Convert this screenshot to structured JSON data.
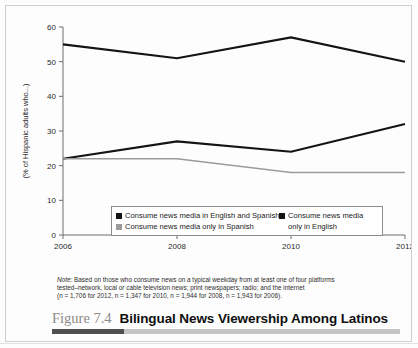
{
  "caption": {
    "figure_number": "Figure 7.4",
    "title": "Bilingual News Viewership Among Latinos"
  },
  "note": {
    "label": "Note:",
    "line1": " Based on those who consume news on a typical weekday from at least one of four platforms",
    "line2": "tested–network, local or cable television news; print newspapers; radio; and the internet",
    "line3": "(n = 1,706 for 2012, n = 1,347 for 2010, n = 1,944 for 2008, n = 1,943 for 2006)."
  },
  "legend": {
    "entries": [
      {
        "label": "Consume news media in English and Spanish",
        "color": "#141414",
        "marker": "square"
      },
      {
        "label": "Consume news media only in Spanish",
        "color": "#9b9b9b",
        "marker": "square"
      },
      {
        "label": "Consume news media only in English",
        "color": "#141414",
        "marker": "square"
      }
    ]
  },
  "chart_data": {
    "type": "line",
    "title": "Bilingual News Viewership Among Latinos",
    "xlabel": "",
    "ylabel": "(% of Hispanic adults who...)",
    "categories": [
      "2006",
      "2008",
      "2010",
      "2012"
    ],
    "x": [
      2006,
      2008,
      2010,
      2012
    ],
    "xlim": [
      2006,
      2012
    ],
    "ylim": [
      0,
      60
    ],
    "yticks": [
      0,
      10,
      20,
      30,
      40,
      50,
      60
    ],
    "xticks": [
      "2006",
      "2008",
      "2010",
      "2012"
    ],
    "grid": false,
    "legend_position": "bottom-center",
    "series": [
      {
        "name": "Consume news media in English and Spanish",
        "color": "#141414",
        "values": [
          55,
          51,
          57,
          50
        ]
      },
      {
        "name": "Consume news media only in English",
        "color": "#141414",
        "values": [
          22,
          27,
          24,
          32
        ]
      },
      {
        "name": "Consume news media only in Spanish",
        "color": "#9b9b9b",
        "values": [
          22,
          22,
          18,
          18
        ]
      }
    ]
  }
}
